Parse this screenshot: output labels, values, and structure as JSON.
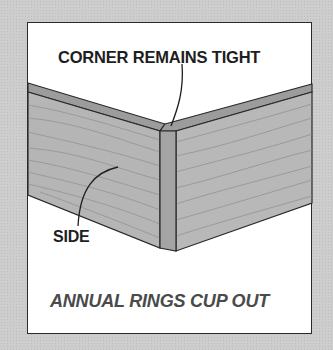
{
  "diagram": {
    "labels": {
      "corner": "CORNER REMAINS TIGHT",
      "side": "SIDE"
    },
    "caption": "ANNUAL RINGS CUP OUT",
    "colors": {
      "background": "#cdcdcd",
      "panel": "#ffffff",
      "wood": "#b4b4b4",
      "wood_top": "#9c9c9c",
      "outline": "#2a2a2a",
      "caption": "#4a4a4a"
    }
  }
}
